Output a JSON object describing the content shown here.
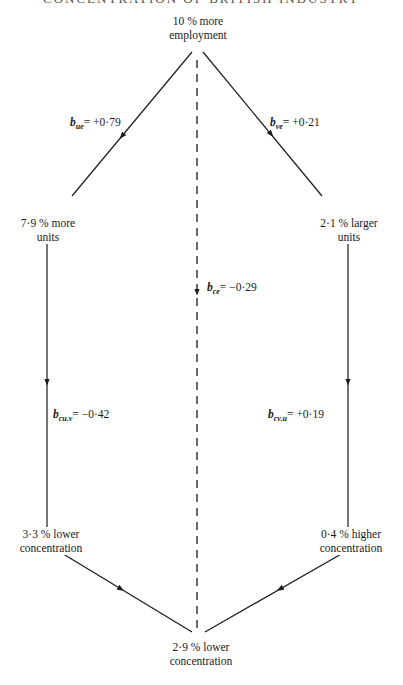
{
  "header": {
    "text": "CONCENTRATION OF BRITISH INDUSTRY"
  },
  "nodes": {
    "top": {
      "line1": "10 % more",
      "line2": "employment"
    },
    "left_mid": {
      "line1": "7·9 % more",
      "line2": "units"
    },
    "right_mid": {
      "line1": "2·1 % larger",
      "line2": "units"
    },
    "left_low": {
      "line1": "3·3 % lower",
      "line2": "concentration"
    },
    "right_low": {
      "line1": "0·4 % higher",
      "line2": "concentration"
    },
    "bottom": {
      "line1": "2·9 % lower",
      "line2": "concentration"
    }
  },
  "coefficients": {
    "b_ue": {
      "symbol": "b",
      "subscript": "ue",
      "value": "= +0·79"
    },
    "b_ve": {
      "symbol": "b",
      "subscript": "ve",
      "value": "= +0·21"
    },
    "b_ce": {
      "symbol": "b",
      "subscript": "ce",
      "value": "= −0·29"
    },
    "b_cu_v": {
      "symbol": "b",
      "subscript": "cu.v",
      "value": "= −0·42"
    },
    "b_cv_u": {
      "symbol": "b",
      "subscript": "cv.u",
      "value": "= +0·19"
    }
  },
  "colors": {
    "line": "#1a1a1a",
    "background": "#ffffff"
  }
}
